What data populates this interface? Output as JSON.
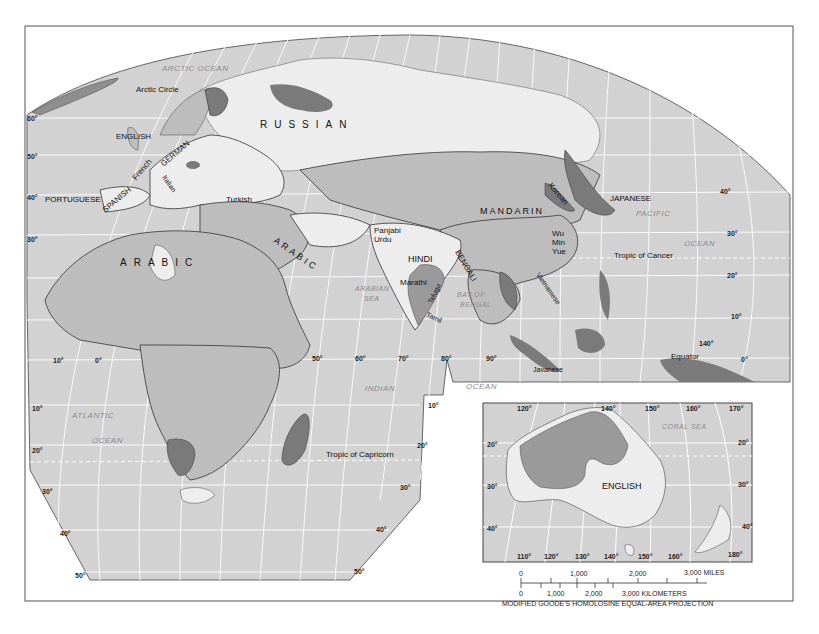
{
  "map": {
    "title": "World Languages — Eastern Hemisphere",
    "projection_note": "MODIFIED GOODE'S HOMOLOSINE EQUAL-AREA PROJECTION",
    "colors": {
      "ocean": "#d2d2d2",
      "land_medium": "#bdbdbd",
      "land_light": "#ededed",
      "land_dark": "#7a7a7a",
      "border": "#333333",
      "graticule": "#ffffff",
      "frame": "#555555"
    },
    "ocean_labels": {
      "arctic": "ARCTIC OCEAN",
      "atlantic_1": "ATLANTIC",
      "atlantic_2": "OCEAN",
      "indian_1": "INDIAN",
      "indian_2": "OCEAN",
      "pacific_1": "PACIFIC",
      "pacific_2": "OCEAN",
      "arabian_1": "ARABIAN",
      "arabian_2": "SEA",
      "bengal_1": "BAY OF",
      "bengal_2": "BENGAL",
      "coral_sea": "CORAL SEA"
    },
    "reference_lines": {
      "arctic_circle": "Arctic Circle",
      "tropic_cancer": "Tropic of Cancer",
      "tropic_capricorn": "Tropic of Capricorn",
      "equator": "Equator"
    },
    "language_labels": {
      "russian": "RUSSIAN",
      "english_uk": "ENGLISH",
      "german": "GERMAN",
      "french": "French",
      "italian": "Italian",
      "spanish": "SPANISH",
      "portuguese": "PORTUGUESE",
      "turkish": "Turkish",
      "arabic_africa": "ARABIC",
      "arabic_arabia": "ARABIC",
      "panjabi": "Panjabi",
      "urdu": "Urdu",
      "hindi": "HINDI",
      "bengali": "BENGALI",
      "marathi": "Marathi",
      "telugu": "Telugu",
      "tamil": "Tamil",
      "mandarin": "MANDARIN",
      "korean": "Korean",
      "japanese": "JAPANESE",
      "wu": "Wu",
      "min": "Min",
      "yue": "Yue",
      "vietnamese": "Vietnamese",
      "javanese": "Javanese",
      "english_aus": "ENGLISH"
    },
    "lat_ticks_left": [
      "60°",
      "50°",
      "40°",
      "30°"
    ],
    "lat_ticks_right": [
      "40°",
      "30°",
      "20°",
      "10°",
      "0°"
    ],
    "lon_ticks_mid": [
      "10°",
      "0°",
      "50°",
      "60°",
      "70°",
      "80°",
      "90°",
      "140°"
    ],
    "south_lat_ticks_left": [
      "10°",
      "20°",
      "30°",
      "40°",
      "50°"
    ],
    "south_lat_ticks_right": [
      "10°",
      "20°",
      "30°",
      "40°",
      "50°"
    ],
    "inset": {
      "top_lon_ticks": [
        "120°",
        "140°",
        "150°",
        "160°",
        "170°"
      ],
      "bottom_lon_ticks": [
        "110°",
        "120°",
        "130°",
        "140°",
        "150°",
        "160°",
        "180°"
      ],
      "left_lat_ticks": [
        "20°",
        "30°",
        "40°"
      ],
      "right_lat_ticks": [
        "20°",
        "30°",
        "40°"
      ]
    },
    "scale_bar": {
      "miles_labels": [
        "0",
        "1,000",
        "2,000",
        "3,000 MILES"
      ],
      "km_labels": [
        "0",
        "1,000",
        "2,000",
        "3,000 KILOMETERS"
      ]
    }
  }
}
